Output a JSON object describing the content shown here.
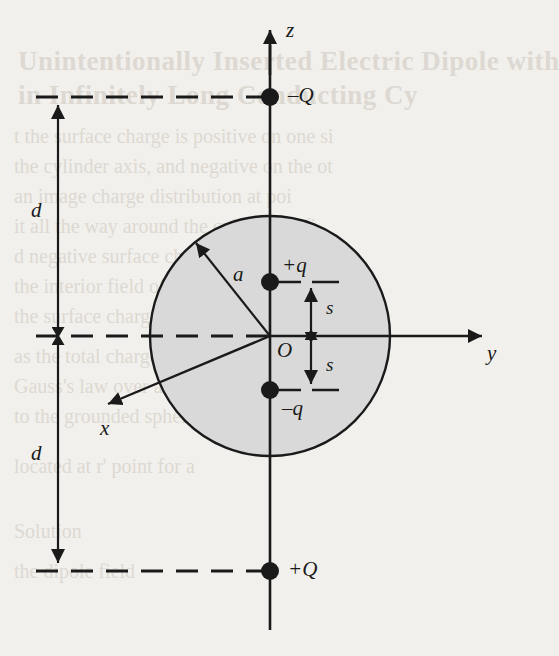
{
  "figure": {
    "background_color": "#f2f0ec",
    "ink_color": "#1a1a1a",
    "sphere_fill": "#d9d9d9",
    "axes": [
      {
        "name": "z",
        "label": "z",
        "direction": "up"
      },
      {
        "name": "y",
        "label": "y",
        "direction": "right"
      },
      {
        "name": "x",
        "label": "x",
        "direction": "lower-left"
      }
    ],
    "charges": [
      {
        "name": "upper-external-charge",
        "label": "–Q",
        "position": "top of z-axis, distance d above sphere center plane"
      },
      {
        "name": "dipole-positive-charge",
        "label": "+q",
        "position": "on z-axis, distance s above origin"
      },
      {
        "name": "dipole-negative-charge",
        "label": "–q",
        "position": "on z-axis, distance s below origin"
      },
      {
        "name": "lower-external-charge",
        "label": "+Q",
        "position": "bottom of z-axis, distance d below sphere center plane"
      }
    ],
    "dimensions": [
      {
        "name": "distance-d-upper",
        "label": "d"
      },
      {
        "name": "distance-d-lower",
        "label": "d"
      },
      {
        "name": "dipole-half-separation-upper",
        "label": "s"
      },
      {
        "name": "dipole-half-separation-lower",
        "label": "s"
      },
      {
        "name": "sphere-radius",
        "label": "a"
      }
    ],
    "origin": {
      "name": "origin",
      "label": "O"
    }
  },
  "page_text": {
    "show_through": [
      "Unintentionally Inserted Electric Dipole with",
      "...in Infinitely Long Conducting Cylinder...",
      "...the surface charge is positive on one side...",
      "...the cylinder axis, and negative on the other...",
      "...the image charge distribution at points...",
      "...it all the way around the cylinder to find the...",
      "...and negative surface charge on the cylinder...",
      "...the interior field of the sphere...",
      "...the surface charge density is zero...",
      "...as the total charge for all the dipoles...",
      "...Gauss's law over a spherical surface...",
      "...to the grounded sphere...",
      "...located at r' point for a..."
    ]
  }
}
